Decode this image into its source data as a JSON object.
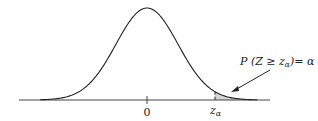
{
  "chart_data": {
    "type": "area",
    "title": "",
    "xlabel": "",
    "ylabel": "",
    "tick_labels": [
      "0",
      "z_α"
    ],
    "critical_value_label": "z",
    "critical_value_subscript": "α",
    "shaded_region": "right tail, x ≥ z_α",
    "annotation": {
      "prefix": "P (Z ≥ z",
      "subscript": "α",
      "suffix": ")= α"
    },
    "grid": false,
    "legend": "none"
  },
  "colors": {
    "curve": "#222222",
    "shade": "#d4d4d4",
    "axis": "#444444"
  }
}
